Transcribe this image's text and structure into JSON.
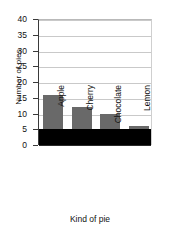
{
  "chart_data": {
    "type": "bar",
    "title": "",
    "xlabel": "Kind of pie",
    "ylabel": "Number of pies",
    "categories": [
      "Apple",
      "Cherry",
      "Chocolate",
      "Lemon"
    ],
    "values": [
      16,
      12,
      10,
      6
    ],
    "series": [
      {
        "name": "Number of pies",
        "values": [
          16,
          12,
          10,
          6
        ]
      }
    ],
    "ylim": [
      0,
      40
    ],
    "yticks": [
      0,
      5,
      10,
      15,
      20,
      25,
      30,
      35,
      40
    ],
    "ytick_labels": [
      "0",
      "5",
      "10",
      "15",
      "20",
      "25",
      "30",
      "35",
      "40"
    ],
    "grid": true,
    "legend": false,
    "legend_position": "none",
    "bar_color": "#696969",
    "grid_color": "#c9c9c9",
    "axis_color": "#3a3a3a",
    "plot_background": "#ffffff",
    "mask_band": {
      "description": "solid black band covering values 0 to 5",
      "from": 0,
      "to": 5,
      "color": "#000000"
    }
  }
}
